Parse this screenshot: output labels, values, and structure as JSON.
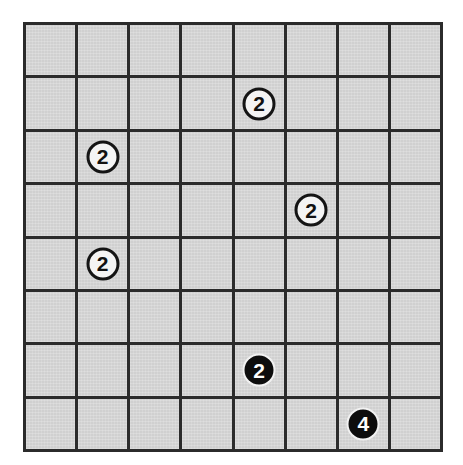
{
  "puzzle": {
    "type": "grid-logic-puzzle",
    "grid": {
      "rows": 8,
      "columns": 8,
      "cell_fill_color": "#d4d4d4",
      "line_color": "#2b2b2b",
      "background_color": "#ffffff"
    },
    "clues": [
      {
        "id": "clue-r2c5",
        "row": 2,
        "column": 5,
        "value": "2",
        "style": "white",
        "fill_color": "#f4f4f4",
        "text_color": "#121212"
      },
      {
        "id": "clue-r3c2",
        "row": 3,
        "column": 2,
        "value": "2",
        "style": "white",
        "fill_color": "#f4f4f4",
        "text_color": "#121212"
      },
      {
        "id": "clue-r4c6",
        "row": 4,
        "column": 6,
        "value": "2",
        "style": "white",
        "fill_color": "#f4f4f4",
        "text_color": "#121212"
      },
      {
        "id": "clue-r5c2",
        "row": 5,
        "column": 2,
        "value": "2",
        "style": "white",
        "fill_color": "#f4f4f4",
        "text_color": "#121212"
      },
      {
        "id": "clue-r7c5",
        "row": 7,
        "column": 5,
        "value": "2",
        "style": "black",
        "fill_color": "#0d0d0d",
        "text_color": "#fdfdfd"
      },
      {
        "id": "clue-r8c7",
        "row": 8,
        "column": 7,
        "value": "4",
        "style": "black",
        "fill_color": "#0d0d0d",
        "text_color": "#fdfdfd"
      }
    ]
  }
}
